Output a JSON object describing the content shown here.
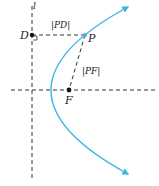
{
  "diagram": {
    "colors": {
      "curve": "#3db3e3",
      "dashed": "#333333",
      "points": "#111111"
    },
    "labels": {
      "directrix": "l",
      "point_d": "D",
      "point_p": "P",
      "point_f": "F",
      "segment_pd": "|PD|",
      "segment_pf": "|PF|"
    },
    "elements": [
      {
        "type": "line",
        "name": "directrix",
        "style": "dashed",
        "orientation": "vertical"
      },
      {
        "type": "line",
        "name": "axis",
        "style": "dashed",
        "orientation": "horizontal"
      },
      {
        "type": "curve",
        "name": "parabola",
        "opens": "right",
        "arrows": "both ends"
      },
      {
        "type": "point",
        "name": "D",
        "on": "directrix"
      },
      {
        "type": "point",
        "name": "P",
        "on": "parabola"
      },
      {
        "type": "point",
        "name": "F",
        "role": "focus"
      },
      {
        "type": "segment",
        "name": "PD",
        "style": "dashed",
        "right_angle_at": "D"
      },
      {
        "type": "segment",
        "name": "PF",
        "style": "dashed"
      }
    ]
  }
}
